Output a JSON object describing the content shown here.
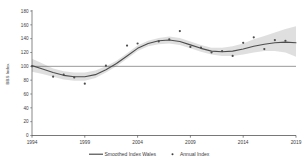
{
  "chart_data": {
    "type": "line",
    "title": "",
    "xlabel": "",
    "ylabel": "BBS Index",
    "xlim": [
      1994,
      2019
    ],
    "ylim": [
      0,
      180
    ],
    "grid": false,
    "legend_position": "bottom",
    "x_ticks": [
      "1994",
      "1999",
      "2004",
      "2009",
      "2014",
      "2019"
    ],
    "y_ticks": [
      "0",
      "20",
      "40",
      "60",
      "80",
      "100",
      "120",
      "140",
      "160",
      "180"
    ],
    "reference_line": {
      "label": "",
      "value": 100
    },
    "x": [
      1994,
      1995,
      1996,
      1997,
      1998,
      1999,
      2000,
      2001,
      2002,
      2003,
      2004,
      2005,
      2006,
      2007,
      2008,
      2009,
      2010,
      2011,
      2012,
      2013,
      2014,
      2015,
      2016,
      2017,
      2018,
      2019
    ],
    "series": [
      {
        "name": "Smoothed Index Wales",
        "type": "line",
        "color": "#4d4d4d",
        "values": [
          101,
          96,
          91,
          87,
          85,
          85,
          88,
          95,
          104,
          115,
          126,
          133,
          137,
          138,
          136,
          131,
          126,
          122,
          121,
          122,
          125,
          129,
          132,
          134,
          135,
          134
        ]
      },
      {
        "name": "Annual Index",
        "type": "scatter",
        "color": "#4d4d4d",
        "values": [
          100,
          null,
          85,
          88,
          84,
          75,
          null,
          101,
          null,
          130,
          133,
          null,
          136,
          139,
          151,
          128,
          127,
          120,
          122,
          115,
          134,
          142,
          125,
          138,
          137,
          null
        ]
      }
    ],
    "confidence_band": {
      "name": "confidence-interval",
      "color": "#d9d9d9",
      "lower": [
        92,
        89,
        85,
        81,
        79,
        79,
        83,
        91,
        100,
        111,
        122,
        129,
        132,
        133,
        131,
        126,
        121,
        117,
        115,
        115,
        117,
        120,
        122,
        122,
        120,
        114
      ],
      "upper": [
        111,
        104,
        97,
        93,
        91,
        91,
        94,
        100,
        108,
        119,
        130,
        137,
        141,
        143,
        141,
        136,
        131,
        127,
        127,
        129,
        133,
        139,
        144,
        149,
        154,
        158
      ]
    }
  },
  "legend": {
    "items": [
      {
        "label": "Smoothed Index Wales",
        "marker": "line"
      },
      {
        "label": "Annual Index",
        "marker": "dot"
      }
    ]
  },
  "axis": {
    "y_title": "BBS Index"
  }
}
